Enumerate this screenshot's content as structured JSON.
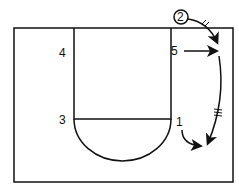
{
  "diagram": {
    "type": "basketball-half-court-play",
    "players": [
      {
        "id": "p1",
        "label": "1",
        "x": 178,
        "y": 117
      },
      {
        "id": "p2",
        "label": "2",
        "x": 178,
        "y": 12,
        "circled": true
      },
      {
        "id": "p3",
        "label": "3",
        "x": 60,
        "y": 117
      },
      {
        "id": "p4",
        "label": "4",
        "x": 60,
        "y": 48
      },
      {
        "id": "p5",
        "label": "5",
        "x": 172,
        "y": 48
      }
    ],
    "actions": [
      {
        "from": "2",
        "type": "dribble",
        "desc": "2 dribbles to right wing"
      },
      {
        "from": "5",
        "type": "cut",
        "desc": "5 cuts toward right sideline"
      },
      {
        "from": "wing",
        "type": "dribble",
        "desc": "dribble down right side to corner"
      },
      {
        "from": "1",
        "type": "cut",
        "desc": "1 cuts to right corner"
      }
    ],
    "colors": {
      "line": "#111111",
      "background": "#ffffff"
    }
  }
}
